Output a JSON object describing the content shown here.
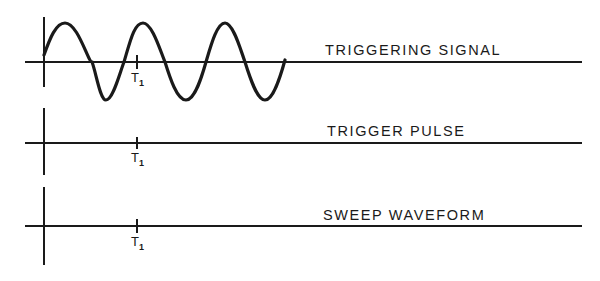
{
  "diagram": {
    "traces": [
      {
        "id": "triggering-signal",
        "label": "TRIGGERING SIGNAL",
        "marker": "T",
        "marker_sub": "1",
        "waveform": "sine"
      },
      {
        "id": "trigger-pulse",
        "label": "TRIGGER PULSE",
        "marker": "T",
        "marker_sub": "1",
        "waveform": "flat"
      },
      {
        "id": "sweep-waveform",
        "label": "SWEEP WAVEFORM",
        "marker": "T",
        "marker_sub": "1",
        "waveform": "flat"
      }
    ],
    "colors": {
      "ink": "#1a1a1a",
      "background": "#ffffff"
    }
  }
}
